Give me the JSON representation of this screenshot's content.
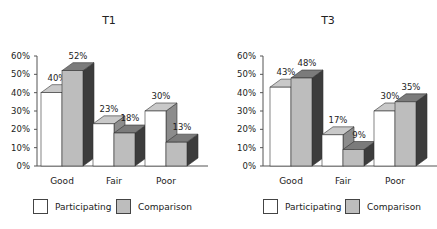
{
  "chart_data": [
    {
      "type": "bar",
      "title": "T1",
      "categories": [
        "Good",
        "Fair",
        "Poor"
      ],
      "series": [
        {
          "name": "Participating",
          "values": [
            40,
            23,
            30
          ]
        },
        {
          "name": "Comparison",
          "values": [
            52,
            18,
            13
          ]
        }
      ],
      "data_labels": [
        [
          "40%",
          "23%",
          "30%"
        ],
        [
          "52%",
          "18%",
          "13%"
        ]
      ],
      "xlabel": "",
      "ylabel": "",
      "ylim": [
        0,
        60
      ],
      "yticks": [
        "0%",
        "10%",
        "20%",
        "30%",
        "40%",
        "50%",
        "60%"
      ],
      "style": "3d-bar",
      "legend_position": "bottom",
      "grid": false
    },
    {
      "type": "bar",
      "title": "T3",
      "categories": [
        "Good",
        "Fair",
        "Poor"
      ],
      "series": [
        {
          "name": "Participating",
          "values": [
            43,
            17,
            30
          ]
        },
        {
          "name": "Comparison",
          "values": [
            48,
            9,
            35
          ]
        }
      ],
      "data_labels": [
        [
          "43%",
          "17%",
          "30%"
        ],
        [
          "48%",
          "9%",
          "35%"
        ]
      ],
      "xlabel": "",
      "ylabel": "",
      "ylim": [
        0,
        60
      ],
      "yticks": [
        "0%",
        "10%",
        "20%",
        "30%",
        "40%",
        "50%",
        "60%"
      ],
      "style": "3d-bar",
      "legend_position": "bottom",
      "grid": false
    }
  ],
  "legend": {
    "participating": "Participating",
    "comparison": "Comparison"
  },
  "colors": {
    "participating_face": "#ffffff",
    "participating_top": "#c9c9c9",
    "participating_side": "#8c8c8c",
    "comparison_face": "#bdbdbd",
    "comparison_top": "#7b7b7b",
    "comparison_side": "#3c3c3c",
    "outline": "#333333"
  }
}
